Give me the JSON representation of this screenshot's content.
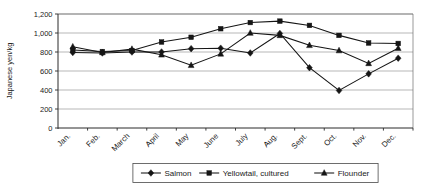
{
  "chart_data": {
    "type": "line",
    "title": "",
    "xlabel": "",
    "ylabel": "Japanese yen/kg",
    "ylim": [
      0,
      1200
    ],
    "ytick_step": 200,
    "yticks": [
      "0",
      "200",
      "400",
      "600",
      "800",
      "1,000",
      "1,200"
    ],
    "grid": true,
    "legend_position": "bottom",
    "categories": [
      "Jan.",
      "Feb.",
      "March",
      "April",
      "May",
      "June",
      "July",
      "Aug.",
      "Sept.",
      "Oct.",
      "Nov.",
      "Dec."
    ],
    "series": [
      {
        "name": "Salmon",
        "marker": "diamond",
        "values": [
          795,
          790,
          800,
          800,
          835,
          840,
          790,
          995,
          635,
          395,
          570,
          735
        ]
      },
      {
        "name": "Yellowtail, cultured",
        "marker": "square",
        "values": [
          820,
          805,
          815,
          905,
          955,
          1045,
          1110,
          1125,
          1080,
          975,
          895,
          890
        ]
      },
      {
        "name": "Flounder",
        "marker": "triangle",
        "values": [
          855,
          795,
          830,
          770,
          660,
          780,
          1000,
          975,
          870,
          815,
          680,
          840
        ]
      }
    ],
    "colors": {
      "series": "#151515",
      "gridline": "#9a9a9a",
      "axis": "#2b2b2b",
      "background": "#ffffff"
    }
  },
  "legend": {
    "entries": [
      {
        "label": "Salmon",
        "marker": "diamond-marker-icon"
      },
      {
        "label": "Yellowtail, cultured",
        "marker": "square-marker-icon"
      },
      {
        "label": "Flounder",
        "marker": "triangle-marker-icon"
      }
    ]
  }
}
